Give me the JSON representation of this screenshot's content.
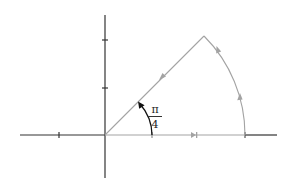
{
  "diagram": {
    "colors": {
      "axes": "#333333",
      "contour": "#a3a3a3",
      "angle_marker": "#111111"
    },
    "angle_label": {
      "numerator": "π",
      "denominator": "4"
    },
    "geometry": {
      "origin": [
        105,
        135
      ],
      "radius_px": 140,
      "angle_deg": 45,
      "x_axis": [
        20,
        277
      ],
      "y_axis": [
        15,
        178
      ],
      "x_ticks": [
        59,
        152,
        245
      ],
      "y_ticks": [
        40,
        88
      ]
    },
    "contour_segments": [
      {
        "name": "real-axis-segment",
        "direction": "outward (left to right)"
      },
      {
        "name": "outer-arc",
        "direction": "counterclockwise"
      },
      {
        "name": "diagonal-ray",
        "direction": "inward toward origin"
      }
    ]
  }
}
